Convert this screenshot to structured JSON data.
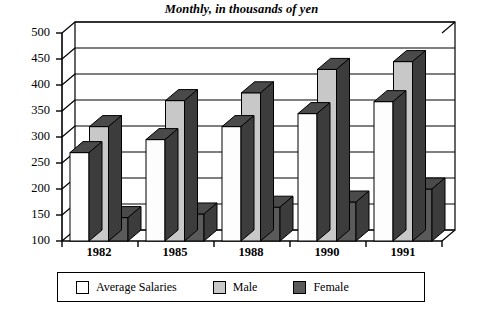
{
  "chart_data": {
    "type": "bar",
    "title": "Monthly, in thousands of yen",
    "xlabel": "",
    "ylabel": "",
    "categories": [
      "1982",
      "1985",
      "1988",
      "1990",
      "1991"
    ],
    "series": [
      {
        "name": "Average Salaries",
        "color": "#fdfdfd",
        "values": [
          270,
          295,
          320,
          345,
          368
        ]
      },
      {
        "name": "Male",
        "color": "#c8c8c8",
        "values": [
          320,
          370,
          385,
          430,
          445
        ]
      },
      {
        "name": "Female",
        "color": "#5a5a5a",
        "values": [
          145,
          152,
          165,
          175,
          200
        ]
      }
    ],
    "ylim": [
      100,
      500
    ],
    "yticks": [
      100,
      150,
      200,
      250,
      300,
      350,
      400,
      450,
      500
    ],
    "ytick_labels": [
      "100",
      "150",
      "200",
      "250",
      "300",
      "350",
      "400",
      "450",
      "500"
    ],
    "grid": true,
    "legend_position": "bottom",
    "style": "3d-column"
  },
  "colors": {
    "average_salaries": "#fdfdfd",
    "male": "#c8c8c8",
    "female": "#5a5a5a",
    "top_face_dark": "#4a4a4a",
    "side_face_dark": "#3c3c3c",
    "axis": "#000000",
    "background": "#ffffff"
  }
}
